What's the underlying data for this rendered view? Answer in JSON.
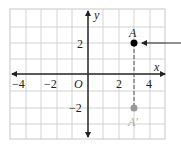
{
  "diagram": {
    "grid": {
      "x_min": -5,
      "x_max": 5,
      "y_min": -4,
      "y_max": 4
    },
    "axes": {
      "x_label": "x",
      "y_label": "y",
      "origin_label": "O"
    },
    "x_ticks": [
      {
        "value": -4,
        "label": "−4"
      },
      {
        "value": -2,
        "label": "−2"
      },
      {
        "value": 2,
        "label": "2"
      },
      {
        "value": 4,
        "label": "4"
      }
    ],
    "y_ticks": [
      {
        "value": 2,
        "label": "2"
      },
      {
        "value": -2,
        "label": "−2"
      }
    ],
    "points": [
      {
        "name": "A",
        "x": 3,
        "y": 2,
        "color": "#000000"
      },
      {
        "name": "A′",
        "x": 3,
        "y": -2,
        "color": "#999999"
      }
    ],
    "reflection_segment": {
      "from": "A",
      "to": "A′",
      "style": "dashed"
    },
    "pointer_arrow": {
      "target": "A",
      "direction": "left"
    }
  }
}
